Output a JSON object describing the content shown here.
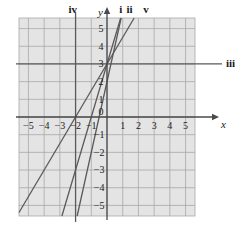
{
  "figure": {
    "kind": "coordinate-plane-line-graph",
    "background": "#ffffff",
    "plot_fill": "#e4e4e4",
    "grid_color": "#a8a8a8",
    "axis_color": "#4a4a4a",
    "line_color": "#5a5a5a",
    "text_color": "#1a1a1a"
  },
  "axes": {
    "x_label": "x",
    "y_label": "y",
    "xlim": [
      -5.6,
      5.6
    ],
    "ylim": [
      -5.6,
      5.6
    ],
    "x_ticks": [
      -5,
      -4,
      -3,
      -2,
      -1,
      1,
      2,
      3,
      4,
      5
    ],
    "y_ticks": [
      5,
      4,
      3,
      2,
      1,
      -1,
      -2,
      -3,
      -4,
      -5
    ],
    "origin_label": "0",
    "x_tick_labels": [
      "−5",
      "−4",
      "−3",
      "−2",
      "−1",
      "1",
      "2",
      "3",
      "4",
      "5"
    ],
    "y_tick_labels": [
      "5",
      "4",
      "3",
      "2",
      "1",
      "−1",
      "−2",
      "−3",
      "−4",
      "−5"
    ],
    "grid": true
  },
  "chart_data": {
    "type": "line",
    "title": "",
    "xlabel": "x",
    "ylabel": "y",
    "xlim": [
      -5.6,
      5.6
    ],
    "ylim": [
      -5.6,
      5.6
    ],
    "grid": true,
    "series": [
      {
        "name": "i",
        "label": "i",
        "kind": "oblique",
        "slope": 4,
        "intercept": 2,
        "endpoints": [
          [
            -1.9,
            -5.6
          ],
          [
            0.9,
            5.6
          ]
        ]
      },
      {
        "name": "ii",
        "label": "ii",
        "kind": "oblique",
        "slope": 3,
        "intercept": 3,
        "endpoints": [
          [
            -2.87,
            -5.6
          ],
          [
            0.87,
            5.6
          ]
        ]
      },
      {
        "name": "v",
        "label": "v",
        "kind": "oblique",
        "slope": 1.5,
        "intercept": 3,
        "endpoints": [
          [
            -5.6,
            -5.4
          ],
          [
            1.73,
            5.6
          ]
        ]
      },
      {
        "name": "iii",
        "label": "iii",
        "kind": "horizontal",
        "y": 3,
        "endpoints": [
          [
            -5.6,
            3
          ],
          [
            5.6,
            3
          ]
        ]
      },
      {
        "name": "iv",
        "label": "iv",
        "kind": "vertical",
        "x": -2,
        "endpoints": [
          [
            -2,
            -5.6
          ],
          [
            -2,
            5.6
          ]
        ]
      }
    ],
    "annotations": [
      {
        "text": "iv",
        "position": "top",
        "x": -2
      },
      {
        "text": "i",
        "position": "top",
        "x": 0.85
      },
      {
        "text": "ii",
        "position": "top",
        "x": 1.45
      },
      {
        "text": "v",
        "position": "top",
        "x": 2.45
      },
      {
        "text": "iii",
        "position": "right",
        "y": 3
      }
    ]
  },
  "labels": {
    "iv": "iv",
    "i": "i",
    "ii": "ii",
    "v": "v",
    "iii": "iii"
  }
}
